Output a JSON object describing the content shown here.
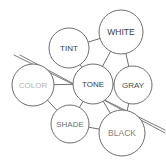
{
  "diagram": {
    "width": 166,
    "height": 164,
    "background": "#ffffff",
    "node_stroke": "#6e6e6e",
    "edge_stroke": "#6e6e6e",
    "cross_line_stroke": "#7a7a7a",
    "nodes": [
      {
        "id": "white",
        "label": "WHITE",
        "cx": 121,
        "cy": 32,
        "r": 22,
        "font_size": 8.5,
        "text_color": "#3c3c3c"
      },
      {
        "id": "tint",
        "label": "TINT",
        "cx": 69,
        "cy": 48,
        "r": 20,
        "font_size": 8.0,
        "text_color": "#3c3c3c"
      },
      {
        "id": "color",
        "label": "COLOR",
        "cx": 33,
        "cy": 85,
        "r": 21,
        "font_size": 8.0,
        "text_color": "#b4b4b4"
      },
      {
        "id": "tone",
        "label": "TONE",
        "cx": 93,
        "cy": 84,
        "r": 20,
        "font_size": 8.0,
        "text_color": "#3c3c3c"
      },
      {
        "id": "gray",
        "label": "GRAY",
        "cx": 133,
        "cy": 85,
        "r": 19,
        "font_size": 8.0,
        "text_color": "#4b4b4b"
      },
      {
        "id": "shade",
        "label": "SHADE",
        "cx": 70,
        "cy": 124,
        "r": 19,
        "font_size": 8.0,
        "text_color": "#707070"
      },
      {
        "id": "black",
        "label": "BLACK",
        "cx": 122,
        "cy": 133,
        "r": 23,
        "font_size": 8.5,
        "text_color": "#828282"
      }
    ],
    "edges": [
      {
        "id": "tint-white",
        "from": "tint",
        "to": "white",
        "x1": 87,
        "y1": 41,
        "x2": 101,
        "y2": 38
      },
      {
        "id": "tint-tone",
        "from": "tint",
        "to": "tone",
        "x1": 75,
        "y1": 67,
        "x2": 85,
        "y2": 65
      },
      {
        "id": "white-tone",
        "from": "white",
        "to": "tone",
        "x1": 113,
        "y1": 53,
        "x2": 100,
        "y2": 65
      },
      {
        "id": "color-tone",
        "from": "color",
        "to": "tone",
        "x1": 54,
        "y1": 84,
        "x2": 73,
        "y2": 84
      },
      {
        "id": "tone-gray",
        "from": "tone",
        "to": "gray",
        "x1": 113,
        "y1": 85,
        "x2": 114,
        "y2": 85
      },
      {
        "id": "white-gray",
        "from": "white",
        "to": "gray",
        "x1": 131,
        "y1": 54,
        "x2": 134,
        "y2": 66
      },
      {
        "id": "tone-shade",
        "from": "tone",
        "to": "shade",
        "x1": 83,
        "y1": 101,
        "x2": 76,
        "y2": 106
      },
      {
        "id": "tone-black",
        "from": "tone",
        "to": "black",
        "x1": 103,
        "y1": 101,
        "x2": 111,
        "y2": 112
      },
      {
        "id": "gray-black",
        "from": "gray",
        "to": "black",
        "x1": 130,
        "y1": 104,
        "x2": 126,
        "y2": 110
      },
      {
        "id": "shade-black",
        "from": "shade",
        "to": "black",
        "x1": 88,
        "y1": 128,
        "x2": 99,
        "y2": 130
      },
      {
        "id": "color-shade",
        "from": "color",
        "to": "shade",
        "x1": 46,
        "y1": 103,
        "x2": 55,
        "y2": 114
      }
    ],
    "cross_lines": [
      {
        "id": "cross-line-upper",
        "x1": 14,
        "y1": 55,
        "x2": 165,
        "y2": 130
      },
      {
        "id": "cross-line-lower",
        "x1": 20,
        "y1": 55,
        "x2": 165,
        "y2": 133
      }
    ]
  }
}
